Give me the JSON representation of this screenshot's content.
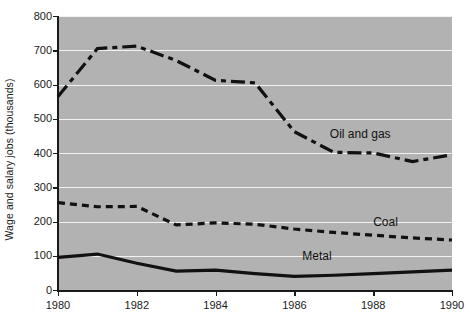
{
  "chart_data": {
    "type": "line",
    "title": "",
    "xlabel": "",
    "ylabel": "Wage and salary jobs (thousands)",
    "xlim": [
      1980,
      1990
    ],
    "ylim": [
      0,
      800
    ],
    "yticks": [
      0,
      100,
      200,
      300,
      400,
      500,
      600,
      700,
      800
    ],
    "xticks": [
      1980,
      1982,
      1984,
      1986,
      1988,
      1990
    ],
    "grid": "horizontal",
    "legend_position": "inline-labels",
    "plot_background": "#b2b2b2",
    "gridline_color": "#f2f2f2",
    "line_color": "#111111",
    "x": [
      1980,
      1981,
      1982,
      1983,
      1984,
      1985,
      1986,
      1987,
      1988,
      1989,
      1990
    ],
    "series": [
      {
        "name": "Oil and gas",
        "style": "dash-dot",
        "values": [
          565,
          705,
          712,
          670,
          612,
          605,
          462,
          402,
          400,
          375,
          395
        ],
        "label_x": 1986.9,
        "label_y": 452
      },
      {
        "name": "Coal",
        "style": "dashed",
        "values": [
          255,
          243,
          244,
          190,
          196,
          192,
          178,
          168,
          160,
          152,
          146
        ],
        "label_x": 1988.0,
        "label_y": 196
      },
      {
        "name": "Metal",
        "style": "solid",
        "values": [
          95,
          105,
          78,
          55,
          58,
          48,
          40,
          43,
          48,
          53,
          58
        ],
        "label_x": 1986.2,
        "label_y": 96
      }
    ]
  }
}
